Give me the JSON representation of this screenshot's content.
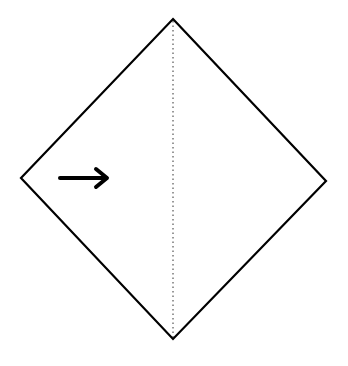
{
  "diagram": {
    "type": "origami-fold-step",
    "shape": "square-diamond",
    "outline_color": "#000000",
    "background": "#ffffff",
    "vertices": {
      "top": [
        173,
        19
      ],
      "right": [
        326,
        181
      ],
      "bottom": [
        173,
        339
      ],
      "left": [
        21,
        178
      ]
    },
    "fold_line": {
      "style": "dotted",
      "kind": "valley-fold",
      "from": [
        173,
        19
      ],
      "to": [
        173,
        339
      ]
    },
    "arrow": {
      "direction": "right",
      "from": [
        60,
        178
      ],
      "to": [
        108,
        178
      ],
      "meaning": "fold left half over to the right"
    }
  }
}
